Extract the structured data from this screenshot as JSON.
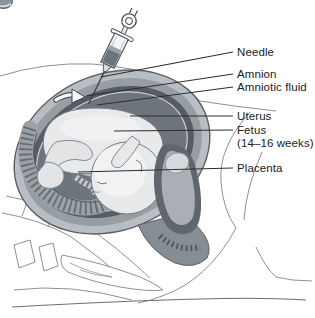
{
  "diagram": {
    "type": "amniocentesis-sagittal-cross-section",
    "labels": [
      {
        "id": "needle",
        "text": "Needle"
      },
      {
        "id": "amnion",
        "text": "Amnion"
      },
      {
        "id": "amniotic-fluid",
        "text": "Amniotic fluid"
      },
      {
        "id": "uterus",
        "text": "Uterus"
      },
      {
        "id": "fetus",
        "text": "Fetus",
        "subtext": "(14–16 weeks)"
      },
      {
        "id": "placenta",
        "text": "Placenta"
      }
    ],
    "colors": {
      "background": "#ffffff",
      "label_text": "#1c1c1c",
      "leader_line": "#2e2e2e",
      "body_outline": "#7d8488",
      "uterine_wall_outer": "#b9bec3",
      "uterine_wall_inner": "#969da3",
      "amniotic_fluid_dark": "#555c64",
      "amniotic_cavity": "#6d747b",
      "amnion_membrane": "#cdd1d4",
      "fetus_skin": "#e8e9ea",
      "placenta_band": "#9aa1a7",
      "cervix_dark": "#5f666d",
      "syringe_fluid": "#6e757c"
    }
  }
}
